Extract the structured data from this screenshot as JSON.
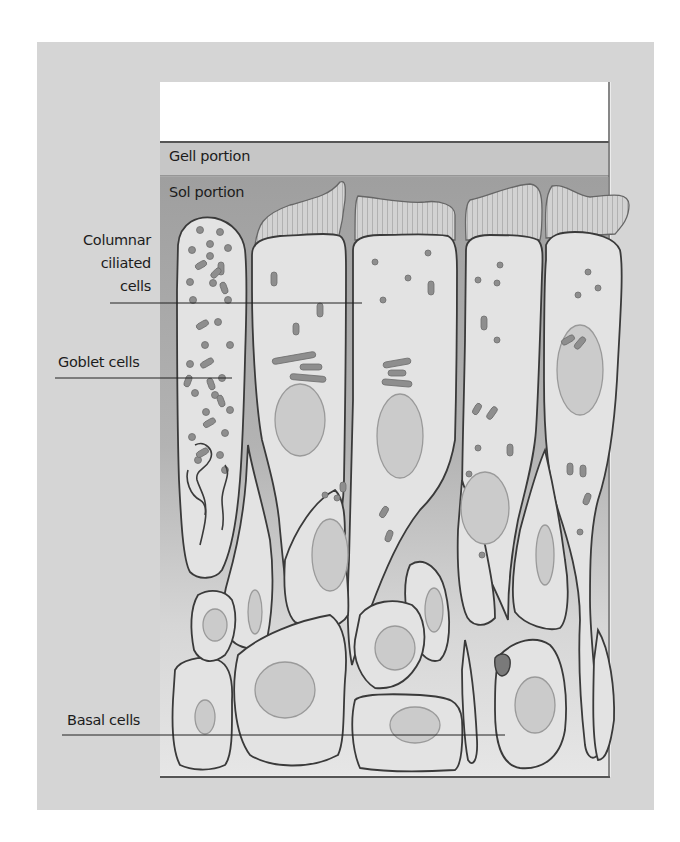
{
  "figure": {
    "bands": {
      "gel": "Gell portion",
      "sol": "Sol portion"
    },
    "labels": {
      "columnar_line1": "Columnar",
      "columnar_line2": "ciliated",
      "columnar_line3": "cells",
      "goblet": "Goblet cells",
      "basal": "Basal cells"
    },
    "colors": {
      "outer_background": "#d4d4d4",
      "frame_background": "#ececec",
      "mucus_top": "#ffffff",
      "gel_band": "#c7c7c7",
      "sol_band": "#a9a9a9",
      "cell_fill": "#e4e4e4",
      "cilia_fill": "#cfcfcf",
      "nucleus_fill": "#cdcdcd",
      "outline": "#3c3c3c",
      "organelle": "#8e8e8e"
    }
  }
}
